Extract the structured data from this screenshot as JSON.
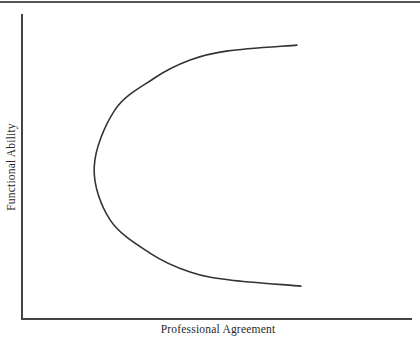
{
  "chart_data": {
    "type": "line",
    "title": "",
    "xlabel": "Professional Agreement",
    "ylabel": "Functional Ability",
    "xlim": [
      0,
      1
    ],
    "ylim": [
      0,
      1
    ],
    "grid": false,
    "legend": null,
    "ticks": {
      "x": [],
      "y": []
    },
    "series": [
      {
        "name": "curve",
        "shape": "sideways parabola (C-shape opening right)",
        "x": [
          0.705,
          0.528,
          0.431,
          0.336,
          0.238,
          0.185,
          0.226,
          0.328,
          0.431,
          0.533,
          0.715
        ],
        "y": [
          0.898,
          0.879,
          0.849,
          0.787,
          0.685,
          0.498,
          0.325,
          0.216,
          0.154,
          0.128,
          0.108
        ]
      }
    ]
  },
  "axes": {
    "x_label": "Professional Agreement",
    "y_label": "Functional Ability"
  },
  "colors": {
    "line": "#333333",
    "axis": "#444444",
    "background": "#ffffff"
  }
}
